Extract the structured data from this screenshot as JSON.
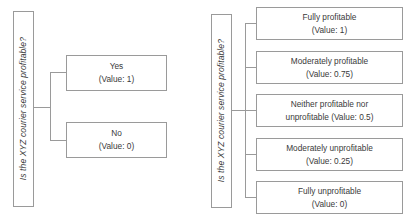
{
  "figure": {
    "type": "tree-diagram",
    "panels": [
      {
        "id": "binary-scale",
        "question": "Is the XYZ courier service profitable?",
        "outcomes": [
          {
            "label": "Yes",
            "value_text": "(Value: 1)",
            "value": 1
          },
          {
            "label": "No",
            "value_text": "(Value: 0)",
            "value": 0
          }
        ]
      },
      {
        "id": "five-point-scale",
        "question": "Is the XYZ courier service profitable?",
        "outcomes": [
          {
            "label": "Fully profitable",
            "value_text": "(Value: 1)",
            "value": 1
          },
          {
            "label": "Moderately profitable",
            "value_text": "(Value: 0.75)",
            "value": 0.75
          },
          {
            "label": "Neither profitable nor",
            "value_text": "unprofitable (Value: 0.5)",
            "value": 0.5
          },
          {
            "label": "Moderately unprofitable",
            "value_text": "(Value: 0.25)",
            "value": 0.25
          },
          {
            "label": "Fully unprofitable",
            "value_text": "(Value: 0)",
            "value": 0
          }
        ]
      }
    ],
    "colors": {
      "border": "#9a9a9a",
      "text": "#3a3a3a",
      "background": "#ffffff"
    }
  }
}
